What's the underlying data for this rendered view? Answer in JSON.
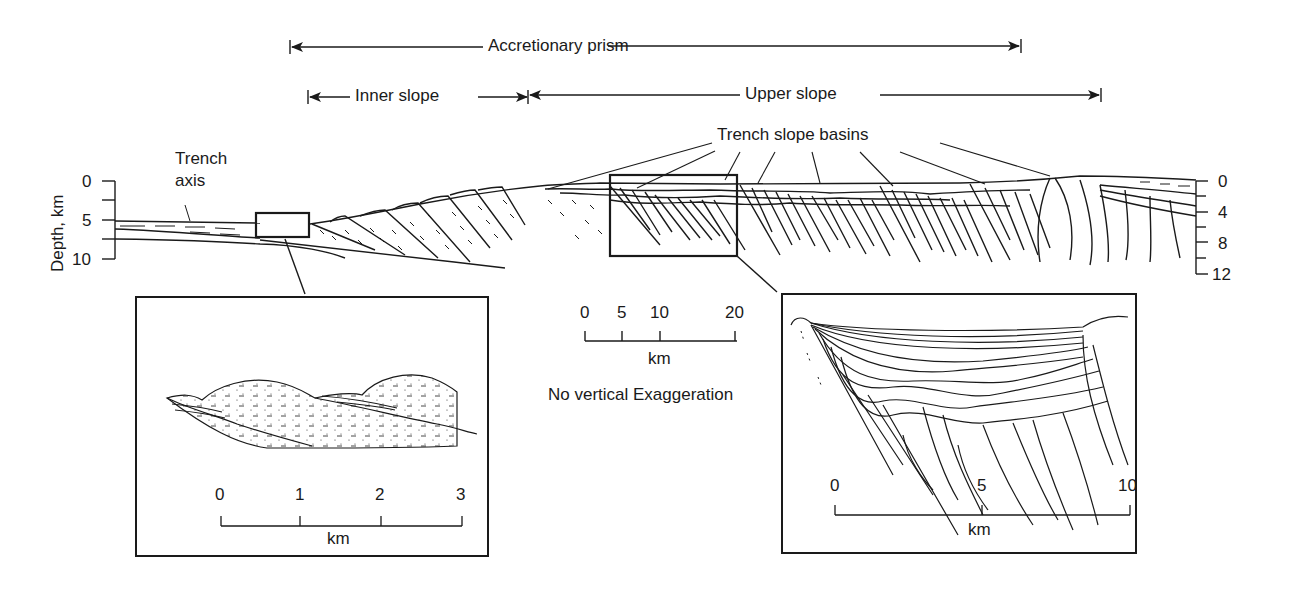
{
  "figure": {
    "spans": {
      "accretionary_prism": "Accretionary prism",
      "inner_slope": "Inner slope",
      "upper_slope": "Upper slope"
    },
    "annotations": {
      "trench_slope_basins": "Trench slope basins",
      "trench_axis_line1": "Trench",
      "trench_axis_line2": "axis",
      "no_vertical_exaggeration": "No vertical Exaggeration"
    },
    "left_depth_axis": {
      "label": "Depth, km",
      "ticks": [
        "0",
        "5",
        "10"
      ]
    },
    "right_depth_axis": {
      "ticks": [
        "0",
        "4",
        "8",
        "12"
      ]
    },
    "main_scale_bar": {
      "ticks": [
        "0",
        "5",
        "10",
        "20"
      ],
      "unit": "km"
    },
    "left_inset": {
      "title": "Trench axis detail",
      "scale_ticks": [
        "0",
        "1",
        "2",
        "3"
      ],
      "unit": "km"
    },
    "right_inset": {
      "title": "Trench slope basin detail",
      "scale_ticks": [
        "0",
        "5",
        "10"
      ],
      "unit": "km"
    },
    "colors": {
      "ink": "#1a1a1a",
      "background": "#ffffff"
    }
  }
}
